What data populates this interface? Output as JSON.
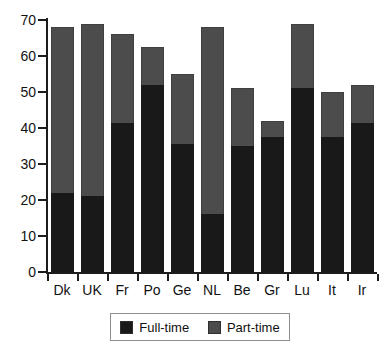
{
  "chart_data": {
    "type": "bar",
    "subtype": "stacked-bar",
    "title": "",
    "subtitle": "",
    "xlabel": "",
    "ylabel": "",
    "ylim": [
      0,
      70
    ],
    "yticks": [
      0,
      10,
      20,
      30,
      40,
      50,
      60,
      70
    ],
    "ytick_labels": [
      "0",
      "10",
      "20",
      "30",
      "40",
      "50",
      "60",
      "70"
    ],
    "grid": false,
    "legend_position": "bottom",
    "categories": [
      "Dk",
      "UK",
      "Fr",
      "Po",
      "Ge",
      "NL",
      "Be",
      "Gr",
      "Lu",
      "It",
      "Ir"
    ],
    "series": [
      {
        "name": "Full-time",
        "color": "#191919",
        "values": [
          22,
          21,
          41.5,
          52,
          35.5,
          16,
          35,
          37.5,
          51,
          37.5,
          41.5
        ]
      },
      {
        "name": "Part-time",
        "color": "#4c4c4c",
        "values": [
          46,
          48,
          24.5,
          10.5,
          19.5,
          52,
          16,
          4.5,
          18,
          12.5,
          10.5
        ]
      }
    ],
    "totals": [
      68,
      69,
      66,
      62.5,
      55,
      68,
      51,
      42,
      69,
      50,
      52
    ]
  },
  "legend": {
    "items": [
      {
        "label": "Full-time",
        "swatch": "full"
      },
      {
        "label": "Part-time",
        "swatch": "part"
      }
    ]
  },
  "colors": {
    "full_time": "#191919",
    "part_time": "#4c4c4c",
    "axis": "#1d1d1d",
    "background": "#ffffff"
  }
}
